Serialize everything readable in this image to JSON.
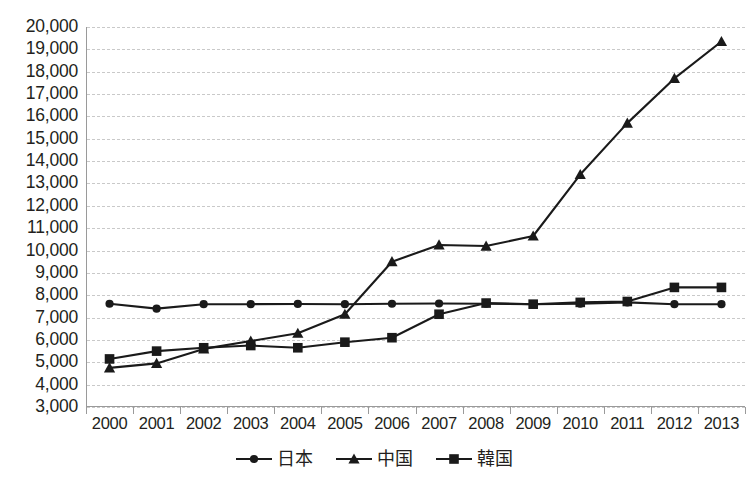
{
  "chart_data": {
    "type": "line",
    "title": "",
    "subtitle": "",
    "xlabel": "",
    "ylabel": "",
    "categories": [
      "2000",
      "2001",
      "2002",
      "2003",
      "2004",
      "2005",
      "2006",
      "2007",
      "2008",
      "2009",
      "2010",
      "2011",
      "2012",
      "2013"
    ],
    "ylim": [
      3000,
      20000
    ],
    "ytick_step": 1000,
    "ytick_labels": [
      "20,000",
      "19,000",
      "18,000",
      "17,000",
      "16,000",
      "15,000",
      "14,000",
      "13,000",
      "12,000",
      "11,000",
      "10,000",
      "9,000",
      "8,000",
      "7,000",
      "6,000",
      "5,000",
      "4,000",
      "3,000"
    ],
    "grid": true,
    "grid_style": "dashed-horizontal",
    "legend_position": "bottom-center",
    "series": [
      {
        "name": "日本",
        "marker": "circle",
        "color": "#1a1a1a",
        "values": [
          7620,
          7400,
          7600,
          7600,
          7610,
          7600,
          7620,
          7630,
          7620,
          7600,
          7620,
          7680,
          7600,
          7600
        ]
      },
      {
        "name": "中国",
        "marker": "triangle",
        "color": "#1a1a1a",
        "values": [
          4750,
          4950,
          5600,
          5950,
          6300,
          7150,
          9500,
          10250,
          10200,
          10650,
          13400,
          15700,
          17700,
          19350
        ]
      },
      {
        "name": "韓国",
        "marker": "square",
        "color": "#1a1a1a",
        "values": [
          5150,
          5500,
          5650,
          5750,
          5650,
          5900,
          6100,
          7150,
          7650,
          7600,
          7680,
          7720,
          8350,
          8350
        ]
      }
    ]
  },
  "legend": {
    "items": [
      {
        "label": "日本",
        "marker": "circle"
      },
      {
        "label": "中国",
        "marker": "triangle"
      },
      {
        "label": "韓国",
        "marker": "square"
      }
    ]
  },
  "colors": {
    "series": "#1a1a1a",
    "grid": "#c9c9c9",
    "axis": "#9a9a9a",
    "text": "#231f20",
    "background": "#ffffff"
  }
}
